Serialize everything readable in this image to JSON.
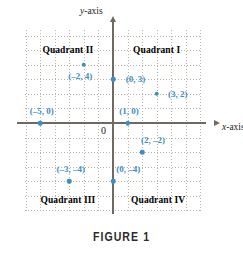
{
  "figure": {
    "caption": "FIGURE 1",
    "accent_color": "#3c8ec4",
    "grid_color": "#b9b2a6",
    "axis_color": "#6e6a63"
  },
  "axes": {
    "x_label_var": "x",
    "x_label_rest": "-axis",
    "y_label_var": "y",
    "y_label_rest": "-axis",
    "origin_label": "0",
    "x_range": [
      -6,
      6
    ],
    "y_range": [
      -6,
      6
    ],
    "grid_step": 1
  },
  "quadrants": [
    {
      "name": "quadrant-1",
      "label": "Quadrant I",
      "x": 3.0,
      "y": 5.0
    },
    {
      "name": "quadrant-2",
      "label": "Quadrant II",
      "x": -3.1,
      "y": 5.0
    },
    {
      "name": "quadrant-3",
      "label": "Quadrant III",
      "x": -3.1,
      "y": -5.3
    },
    {
      "name": "quadrant-4",
      "label": "Quadrant IV",
      "x": 3.1,
      "y": -5.3
    }
  ],
  "chart_data": {
    "type": "scatter",
    "title": "FIGURE 1",
    "xlabel": "x-axis",
    "ylabel": "y-axis",
    "xlim": [
      -6,
      6
    ],
    "ylim": [
      -6,
      6
    ],
    "grid": true,
    "legend": "none",
    "points": [
      {
        "label": "(–2, 4)",
        "x": -2,
        "y": 4,
        "label_dx": -0.25,
        "label_dy": -0.75
      },
      {
        "label": "(0, 3)",
        "x": 0,
        "y": 3,
        "label_dx": 1.55,
        "label_dy": 0.0
      },
      {
        "label": "(3, 2)",
        "x": 3,
        "y": 2,
        "label_dx": 1.45,
        "label_dy": 0.0
      },
      {
        "label": "(–5, 0)",
        "x": -5,
        "y": 0,
        "label_dx": 0.1,
        "label_dy": 0.85
      },
      {
        "label": "(1, 0)",
        "x": 1,
        "y": 0,
        "label_dx": 0.1,
        "label_dy": 0.85
      },
      {
        "label": "(2, –2)",
        "x": 2,
        "y": -2,
        "label_dx": 0.75,
        "label_dy": 0.85
      },
      {
        "label": "(–3, –4)",
        "x": -3,
        "y": -4,
        "label_dx": 0.1,
        "label_dy": 0.85
      },
      {
        "label": "(0, –4)",
        "x": 0,
        "y": -4,
        "label_dx": 1.05,
        "label_dy": 0.85
      }
    ]
  }
}
